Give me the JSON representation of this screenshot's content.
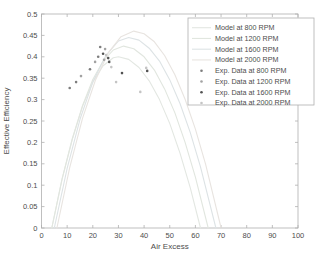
{
  "figure": {
    "background": "#ffffff",
    "axis_box_color": "#b0b0b0",
    "tick_label_color": "#4d4d4d",
    "axis_label_color": "#3f3f3f"
  },
  "chart_data": {
    "type": "line+scatter",
    "title": "",
    "xlabel": "Air Excess",
    "ylabel": "Effective Efficiency",
    "xlim": [
      0,
      100
    ],
    "ylim": [
      0,
      0.5
    ],
    "xticks": [
      0,
      10,
      20,
      30,
      40,
      50,
      60,
      70,
      80,
      90,
      100
    ],
    "xtick_labels": [
      "0",
      "10",
      "20",
      "30",
      "40",
      "50",
      "60",
      "70",
      "80",
      "90",
      "100"
    ],
    "yticks": [
      0,
      0.05,
      0.1,
      0.15,
      0.2,
      0.25,
      0.3,
      0.35,
      0.4,
      0.45,
      0.5
    ],
    "ytick_labels": [
      "0",
      "0.05",
      "0.1",
      "0.15",
      "0.2",
      "0.25",
      "0.3",
      "0.35",
      "0.4",
      "0.45",
      "0.5"
    ],
    "grid": false,
    "legend_position": "upper right",
    "series": [
      {
        "name": "Model at 800 RPM",
        "kind": "line",
        "color": "#e3e7e2",
        "points": [
          [
            4,
            0
          ],
          [
            8,
            0.114
          ],
          [
            12,
            0.208
          ],
          [
            16,
            0.284
          ],
          [
            20,
            0.341
          ],
          [
            24,
            0.379
          ],
          [
            28,
            0.398
          ],
          [
            30,
            0.4
          ],
          [
            34,
            0.394
          ],
          [
            38,
            0.375
          ],
          [
            42,
            0.344
          ],
          [
            46,
            0.3
          ],
          [
            50,
            0.244
          ],
          [
            54,
            0.175
          ],
          [
            58,
            0.094
          ],
          [
            62,
            0
          ]
        ]
      },
      {
        "name": "Model at 1200 RPM",
        "kind": "line",
        "color": "#e1e6df",
        "points": [
          [
            4,
            0
          ],
          [
            8,
            0.113
          ],
          [
            12,
            0.208
          ],
          [
            16,
            0.286
          ],
          [
            20,
            0.347
          ],
          [
            24,
            0.39
          ],
          [
            28,
            0.416
          ],
          [
            32,
            0.425
          ],
          [
            36,
            0.419
          ],
          [
            40,
            0.4
          ],
          [
            44,
            0.369
          ],
          [
            48,
            0.325
          ],
          [
            52,
            0.269
          ],
          [
            56,
            0.2
          ],
          [
            60,
            0.119
          ],
          [
            65,
            0
          ]
        ]
      },
      {
        "name": "Model at 1600 RPM",
        "kind": "line",
        "color": "#dde3e5",
        "points": [
          [
            5,
            0
          ],
          [
            10,
            0.14
          ],
          [
            15,
            0.254
          ],
          [
            20,
            0.341
          ],
          [
            25,
            0.402
          ],
          [
            30,
            0.437
          ],
          [
            34,
            0.445
          ],
          [
            38,
            0.439
          ],
          [
            42,
            0.42
          ],
          [
            46,
            0.39
          ],
          [
            50,
            0.346
          ],
          [
            54,
            0.291
          ],
          [
            58,
            0.223
          ],
          [
            62,
            0.143
          ],
          [
            68,
            0
          ]
        ]
      },
      {
        "name": "Model at 2000 RPM",
        "kind": "line",
        "color": "#e8e4e0",
        "points": [
          [
            6,
            0
          ],
          [
            11,
            0.141
          ],
          [
            16,
            0.256
          ],
          [
            21,
            0.345
          ],
          [
            26,
            0.409
          ],
          [
            31,
            0.447
          ],
          [
            36,
            0.46
          ],
          [
            40,
            0.454
          ],
          [
            44,
            0.435
          ],
          [
            48,
            0.403
          ],
          [
            52,
            0.358
          ],
          [
            56,
            0.301
          ],
          [
            60,
            0.231
          ],
          [
            64,
            0.148
          ],
          [
            70,
            0
          ]
        ]
      },
      {
        "name": "Exp. Data at 800 RPM",
        "kind": "scatter",
        "color": "#7d7d7d",
        "points": [
          [
            11,
            0.327
          ],
          [
            13.5,
            0.341
          ],
          [
            18.9,
            0.371
          ],
          [
            22.1,
            0.4
          ],
          [
            22.9,
            0.423
          ]
        ]
      },
      {
        "name": "Exp. Data at 1200 RPM",
        "kind": "scatter",
        "color": "#a2a2a2",
        "points": [
          [
            15.4,
            0.355
          ],
          [
            20.9,
            0.388
          ],
          [
            24.4,
            0.393
          ],
          [
            24.8,
            0.418
          ]
        ]
      },
      {
        "name": "Exp. Data at 1600 RPM",
        "kind": "scatter",
        "color": "#525252",
        "points": [
          [
            24,
            0.407
          ],
          [
            26,
            0.397
          ],
          [
            26.4,
            0.388
          ],
          [
            31.4,
            0.362
          ],
          [
            41.2,
            0.367
          ]
        ]
      },
      {
        "name": "Exp. Data at 2000 RPM",
        "kind": "scatter",
        "color": "#c4c4c4",
        "points": [
          [
            25.2,
            0.404
          ],
          [
            27.2,
            0.376
          ],
          [
            29.1,
            0.341
          ],
          [
            38.5,
            0.318
          ],
          [
            40.8,
            0.374
          ]
        ]
      }
    ]
  }
}
